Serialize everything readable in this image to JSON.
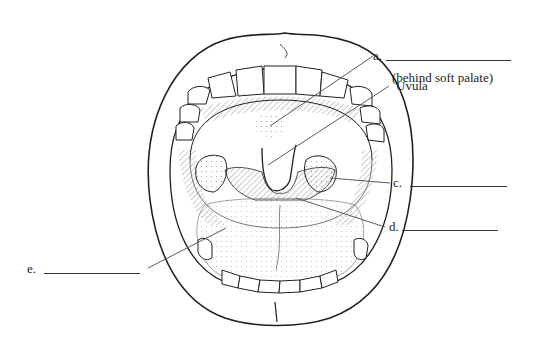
{
  "diagram": {
    "colors": {
      "line": "#231f20",
      "shade": "#b5b5b5",
      "background": "#ffffff"
    },
    "labels": {
      "a": {
        "letter": "a.",
        "note": "(behind soft palate)"
      },
      "uvula": {
        "text": "Uvula"
      },
      "c": {
        "letter": "c."
      },
      "d": {
        "letter": "d."
      },
      "e": {
        "letter": "e."
      }
    },
    "structures": [
      "lips",
      "upper teeth",
      "lower teeth",
      "hard palate",
      "soft palate",
      "uvula",
      "palatine tonsils",
      "tongue",
      "oropharynx"
    ]
  }
}
